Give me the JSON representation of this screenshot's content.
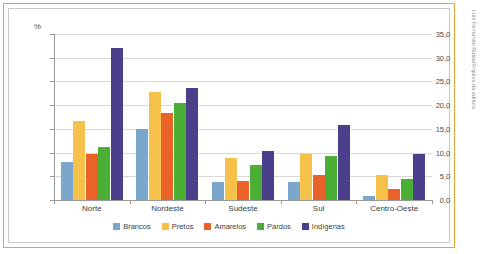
{
  "credit": "Luiz Fernando Rubio/Arquivo da editora",
  "chart_data": {
    "type": "bar",
    "title": "",
    "subtitle": "",
    "xlabel": "",
    "ylabel": "%",
    "ylim": [
      0,
      35
    ],
    "ytick_step": 5,
    "ytick_labels": [
      "0,0",
      "5,0",
      "10,0",
      "15,0",
      "20,0",
      "25,0",
      "30,0",
      "35,0"
    ],
    "ytick_values": [
      0,
      5,
      10,
      15,
      20,
      25,
      30,
      35
    ],
    "grid": true,
    "legend_position": "bottom",
    "categories": [
      "Norte",
      "Nordeste",
      "Sudeste",
      "Sul",
      "Centro-Oeste"
    ],
    "series": [
      {
        "name": "Brancos",
        "color": "#7ba7cc",
        "values": [
          8.0,
          15.0,
          3.7,
          3.9,
          0.8
        ]
      },
      {
        "name": "Pretos",
        "color": "#f5c14a",
        "values": [
          16.6,
          22.7,
          8.8,
          9.6,
          5.2
        ]
      },
      {
        "name": "Amarelos",
        "color": "#e8622a",
        "values": [
          9.7,
          18.4,
          4.0,
          5.2,
          2.4
        ]
      },
      {
        "name": "Pardos",
        "color": "#4caf35",
        "values": [
          11.1,
          20.5,
          7.3,
          9.2,
          4.4
        ]
      },
      {
        "name": "Indígenas",
        "color": "#4b3f8c",
        "values": [
          32.0,
          23.6,
          10.3,
          15.8,
          9.8
        ]
      }
    ]
  },
  "colors": {
    "frame_outer": "#e8a33d",
    "frame_inner": "#c9c9c9",
    "gridline": "#d8d8d8",
    "axis": "#9a9a9a",
    "text": "#3d3d3d"
  }
}
